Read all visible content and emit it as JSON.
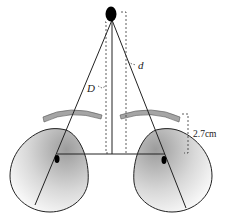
{
  "diagram": {
    "type": "optics-eye-convergence",
    "labels": {
      "far_distance": "d",
      "near_distance": "D",
      "eye_offset": "2.7cm"
    },
    "colors": {
      "line": "#222222",
      "object": "#000000",
      "lens": "#9a9a9a",
      "eye_shade_dark": "#9c9c9c",
      "eye_shade_light": "#ffffff"
    }
  }
}
